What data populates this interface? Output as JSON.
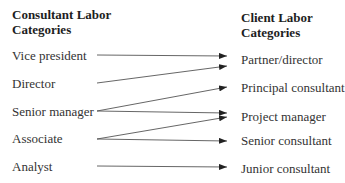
{
  "left_column": {
    "header_line1": "Consultant Labor",
    "header_line2": "Categories",
    "items": [
      {
        "label": "Vice president",
        "y": 55
      },
      {
        "label": "Director",
        "y": 83
      },
      {
        "label": "Senior manager",
        "y": 111
      },
      {
        "label": "Associate",
        "y": 139
      },
      {
        "label": "Analyst",
        "y": 166
      }
    ]
  },
  "right_column": {
    "header_line1": "Client Labor",
    "header_line2": "Categories",
    "items": [
      {
        "label": "Partner/director",
        "y": 60
      },
      {
        "label": "Principal consultant",
        "y": 87
      },
      {
        "label": "Project manager",
        "y": 116
      },
      {
        "label": "Senior consultant",
        "y": 141
      },
      {
        "label": "Junior consultant",
        "y": 168
      }
    ]
  },
  "mappings": [
    {
      "from": "Vice president",
      "to": "Partner/director",
      "x1": 97,
      "y1": 55,
      "x2": 227,
      "y2": 56
    },
    {
      "from": "Director",
      "to": "Partner/director",
      "x1": 97,
      "y1": 83,
      "x2": 227,
      "y2": 66
    },
    {
      "from": "Senior manager",
      "to": "Principal consultant",
      "x1": 97,
      "y1": 111,
      "x2": 227,
      "y2": 87
    },
    {
      "from": "Senior manager",
      "to": "Project manager",
      "x1": 97,
      "y1": 111,
      "x2": 227,
      "y2": 113
    },
    {
      "from": "Associate",
      "to": "Project manager",
      "x1": 97,
      "y1": 139,
      "x2": 227,
      "y2": 117
    },
    {
      "from": "Associate",
      "to": "Senior consultant",
      "x1": 97,
      "y1": 139,
      "x2": 227,
      "y2": 141
    },
    {
      "from": "Analyst",
      "to": "Junior consultant",
      "x1": 97,
      "y1": 166,
      "x2": 227,
      "y2": 167
    }
  ],
  "colors": {
    "line": "#555555",
    "arrowhead": "#222222",
    "text": "#333333"
  }
}
